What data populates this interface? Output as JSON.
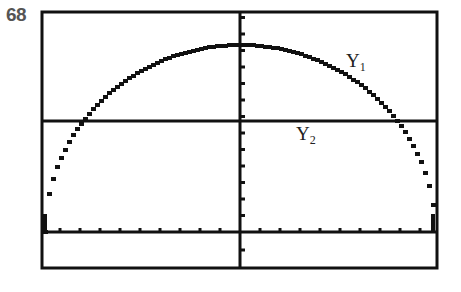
{
  "figure_number": "68",
  "chart_data": {
    "type": "line",
    "title": "",
    "xlabel": "",
    "ylabel": "",
    "grid": false,
    "series": [
      {
        "name": "Y1",
        "label_main": "Y",
        "label_sub": "1",
        "shape": "upper semicircle",
        "endpoints_x": [
          -10,
          10
        ],
        "peak_y": 12
      },
      {
        "name": "Y2",
        "label_main": "Y",
        "label_sub": "2",
        "shape": "horizontal line",
        "y": 7
      }
    ],
    "x_ticks_count_each_side": 10,
    "y_ticks": "unit tick marks",
    "window": {
      "xmin": -10,
      "xmax": 10,
      "ymin": -2,
      "ymax": 14
    }
  },
  "labels": {
    "y1_main": "Y",
    "y1_sub": "1",
    "y2_main": "Y",
    "y2_sub": "2"
  },
  "colors": {
    "ink": "#111111",
    "background": "#ffffff",
    "figure_number": "#555555"
  }
}
